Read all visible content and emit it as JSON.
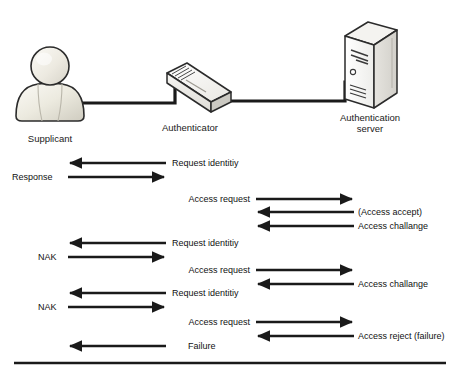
{
  "diagram": {
    "colors": {
      "line": "#1a1a1a",
      "icon_fill_light": "#f2f0ea",
      "icon_fill_mid": "#e2e0d8",
      "icon_fill_dark": "#cfccc2",
      "text": "#111111",
      "background": "#ffffff"
    },
    "nodes": [
      {
        "id": "supplicant",
        "icon": "user-person-icon",
        "label": "Supplicant",
        "label_lines": [
          "Supplicant"
        ]
      },
      {
        "id": "authenticator",
        "icon": "network-switch-icon",
        "label": "Authenticator",
        "label_lines": [
          "Authenticator"
        ]
      },
      {
        "id": "auth-server",
        "icon": "server-tower-icon",
        "label": "Authentication server",
        "label_lines": [
          "Authentication",
          "server"
        ]
      }
    ],
    "links": [
      {
        "id": "link-supplicant-authenticator",
        "from": "supplicant",
        "to": "authenticator"
      },
      {
        "id": "link-authenticator-server",
        "from": "authenticator",
        "to": "auth-server"
      }
    ],
    "messages": [
      {
        "seq": 1,
        "column": "left",
        "direction": "left",
        "label": "Request identitiy",
        "label_side": "right",
        "row_y": 163
      },
      {
        "seq": 2,
        "column": "left",
        "direction": "right",
        "label": "Response",
        "label_side": "left",
        "row_y": 177
      },
      {
        "seq": 3,
        "column": "right",
        "direction": "right",
        "label": "Access request",
        "label_side": "left",
        "row_y": 199
      },
      {
        "seq": 4,
        "column": "right",
        "direction": "left",
        "label": "(Access accept)",
        "label_side": "right",
        "row_y": 212
      },
      {
        "seq": 5,
        "column": "right",
        "direction": "left",
        "label": "Access challange",
        "label_side": "right",
        "row_y": 226
      },
      {
        "seq": 6,
        "column": "left",
        "direction": "left",
        "label": "Request identitiy",
        "label_side": "right",
        "row_y": 243
      },
      {
        "seq": 7,
        "column": "left",
        "direction": "right",
        "label": "NAK",
        "label_side": "left",
        "row_y": 257
      },
      {
        "seq": 8,
        "column": "right",
        "direction": "right",
        "label": "Access request",
        "label_side": "left",
        "row_y": 270
      },
      {
        "seq": 9,
        "column": "right",
        "direction": "left",
        "label": "Access challange",
        "label_side": "right",
        "row_y": 284
      },
      {
        "seq": 10,
        "column": "left",
        "direction": "left",
        "label": "Request identitiy",
        "label_side": "right",
        "row_y": 293
      },
      {
        "seq": 11,
        "column": "left",
        "direction": "right",
        "label": "NAK",
        "label_side": "left",
        "row_y": 307
      },
      {
        "seq": 12,
        "column": "right",
        "direction": "right",
        "label": "Access request",
        "label_side": "left",
        "row_y": 322
      },
      {
        "seq": 13,
        "column": "right",
        "direction": "left",
        "label": "Access reject (failure)",
        "label_side": "right",
        "row_y": 336
      },
      {
        "seq": 14,
        "column": "left",
        "direction": "left",
        "label": "Failure",
        "label_side": "right",
        "row_y": 346
      }
    ],
    "footer_rule": {
      "id": "bottom-divider",
      "y": 363
    }
  }
}
